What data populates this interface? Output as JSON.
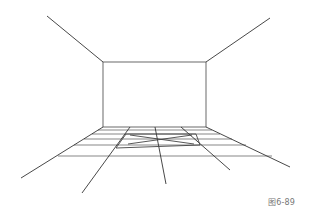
{
  "figure": {
    "caption": "图6-89",
    "colors": {
      "line": "#333333",
      "grid": "#555555",
      "rug": "#444444",
      "background": "#ffffff"
    }
  },
  "room": {
    "back_wall": {
      "x1": 103,
      "y1": 62,
      "x2": 206,
      "y2": 127
    },
    "ceiling_lines": [
      {
        "x1": 47,
        "y1": 16,
        "x2": 103,
        "y2": 62
      },
      {
        "x1": 270,
        "y1": 18,
        "x2": 206,
        "y2": 62
      }
    ],
    "floor_diagonals": [
      {
        "x1": 103,
        "y1": 127,
        "x2": 21,
        "y2": 178
      },
      {
        "x1": 130,
        "y1": 127,
        "x2": 82,
        "y2": 193
      },
      {
        "x1": 155,
        "y1": 127,
        "x2": 166,
        "y2": 184
      },
      {
        "x1": 181,
        "y1": 127,
        "x2": 230,
        "y2": 170
      },
      {
        "x1": 206,
        "y1": 127,
        "x2": 290,
        "y2": 167
      }
    ],
    "floor_horizontals": [
      {
        "y": 130,
        "x1": 98,
        "x2": 212
      },
      {
        "y": 134,
        "x1": 92,
        "x2": 220
      },
      {
        "y": 139,
        "x1": 84,
        "x2": 232
      },
      {
        "y": 145,
        "x1": 74,
        "x2": 246
      },
      {
        "y": 156,
        "x1": 58,
        "x2": 272
      }
    ],
    "rug": {
      "x1": 126,
      "y1": 134,
      "x2": 196,
      "y2": 145,
      "front_left_x": 116,
      "front_y": 148
    }
  }
}
